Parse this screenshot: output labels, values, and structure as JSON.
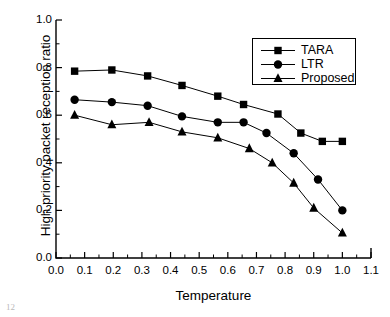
{
  "chart_data": {
    "type": "line",
    "title": "",
    "xlabel": "Temperature",
    "ylabel": "High priority packet reception ratio",
    "xlim": [
      0.0,
      1.1
    ],
    "ylim": [
      0.0,
      1.0
    ],
    "xticks": [
      "0.0",
      "0.1",
      "0.2",
      "0.3",
      "0.4",
      "0.5",
      "0.6",
      "0.7",
      "0.8",
      "0.9",
      "1.0",
      "1.1"
    ],
    "xtick_values": [
      0.0,
      0.1,
      0.2,
      0.3,
      0.4,
      0.5,
      0.6,
      0.7,
      0.8,
      0.9,
      1.0,
      1.1
    ],
    "yticks": [
      "0.0",
      "0.2",
      "0.4",
      "0.6",
      "0.8",
      "1.0"
    ],
    "ytick_values": [
      0.0,
      0.2,
      0.4,
      0.6,
      0.8,
      1.0
    ],
    "minor_ticks": true,
    "grid": false,
    "legend_position": "top-right",
    "series": [
      {
        "name": "TARA",
        "marker": "square",
        "color": "#000000",
        "x": [
          0.065,
          0.195,
          0.32,
          0.44,
          0.565,
          0.655,
          0.775,
          0.855,
          0.93,
          1.0
        ],
        "values": [
          0.785,
          0.79,
          0.765,
          0.725,
          0.68,
          0.645,
          0.605,
          0.525,
          0.49,
          0.49
        ]
      },
      {
        "name": "LTR",
        "marker": "circle",
        "color": "#000000",
        "x": [
          0.065,
          0.195,
          0.32,
          0.44,
          0.565,
          0.655,
          0.735,
          0.83,
          0.915,
          1.0
        ],
        "values": [
          0.665,
          0.655,
          0.64,
          0.595,
          0.57,
          0.57,
          0.525,
          0.44,
          0.33,
          0.2
        ]
      },
      {
        "name": "Proposed",
        "marker": "triangle",
        "color": "#000000",
        "x": [
          0.065,
          0.195,
          0.325,
          0.44,
          0.565,
          0.675,
          0.755,
          0.83,
          0.9,
          1.0
        ],
        "values": [
          0.6,
          0.56,
          0.57,
          0.53,
          0.505,
          0.46,
          0.4,
          0.315,
          0.21,
          0.105
        ]
      }
    ]
  },
  "legend": {
    "entries": [
      {
        "label": "TARA",
        "marker": "square-marker"
      },
      {
        "label": "LTR",
        "marker": "circle-marker"
      },
      {
        "label": "Proposed",
        "marker": "triangle-marker"
      }
    ]
  },
  "page": {
    "artifact": "12"
  }
}
